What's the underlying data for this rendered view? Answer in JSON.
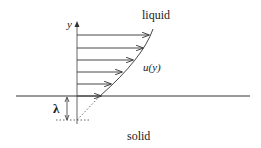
{
  "diagram": {
    "title": "",
    "labels": {
      "axis_y": "y",
      "liquid": "liquid",
      "velocity_profile": "u(y)",
      "slip_length": "λ",
      "solid": "solid"
    },
    "colors": {
      "line": "#333333",
      "text": "#1a1a1a",
      "background": "#ffffff"
    },
    "arrows_count": 6
  }
}
